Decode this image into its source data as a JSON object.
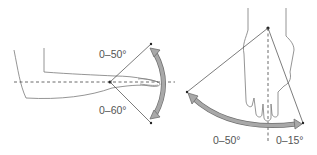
{
  "figure": {
    "panels": [
      {
        "name": "wrist-radial-ulnar-deviation-lateral",
        "labels": {
          "upper": "0–50°",
          "lower": "0–60°"
        }
      },
      {
        "name": "wrist-deviation-dorsal",
        "labels": {
          "left": "0–50°",
          "right": "0–15°"
        }
      }
    ],
    "colors": {
      "line": "#444444",
      "arrow_fill": "#a8a8a8",
      "arrow_stroke": "#6e6e6e",
      "skin_outline": "#7a7a7a"
    }
  }
}
